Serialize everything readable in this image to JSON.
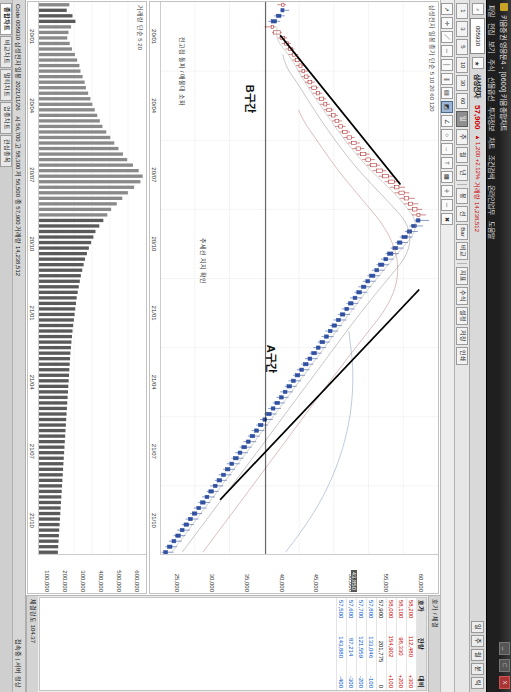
{
  "window": {
    "app_title": "키움증권 영웅문4 - [0600] 키움종합차트",
    "logo_icon": "app-logo-icon",
    "minimize_label": "_",
    "maximize_label": "□",
    "close_label": "X"
  },
  "menu": {
    "items": [
      "파일",
      "편집",
      "보기",
      "주식",
      "선물옵션",
      "투자정보",
      "차트",
      "조건검색",
      "온라인업무",
      "도움말"
    ]
  },
  "quotebar": {
    "code_value": "005930",
    "code_placeholder": "종목코드",
    "stock_name": "삼성전자",
    "chips": [
      "일",
      "주",
      "월",
      "분",
      "틱"
    ],
    "price": "57,900",
    "delta": "▲ 1,200  +2.12%",
    "volume_label": "거래량 14,238,512",
    "search_icon": "search-icon",
    "star_icon": "favorite-star-icon"
  },
  "toolbar_period": {
    "buttons": [
      "1",
      "3",
      "5",
      "10",
      "30",
      "60",
      "일",
      "주",
      "월",
      "년"
    ],
    "active": "일",
    "chart_types": [
      "봉",
      "선",
      "Bar",
      "비교"
    ],
    "extras": [
      "지표",
      "수식",
      "설정",
      "저장",
      "인쇄"
    ]
  },
  "drawing_toolbar": {
    "tools": [
      {
        "name": "pointer-icon",
        "glyph": "➚"
      },
      {
        "name": "crosshair-icon",
        "glyph": "✛"
      },
      {
        "name": "trendline-icon",
        "glyph": "／"
      },
      {
        "name": "horizontal-line-icon",
        "glyph": "─"
      },
      {
        "name": "vertical-line-icon",
        "glyph": "│"
      },
      {
        "name": "parallel-line-icon",
        "glyph": "∥"
      },
      {
        "name": "fibonacci-icon",
        "glyph": "▤"
      },
      {
        "name": "channel-icon",
        "glyph": "◩"
      },
      {
        "name": "angle-icon",
        "glyph": "∠"
      },
      {
        "name": "ellipse-icon",
        "glyph": "○"
      },
      {
        "name": "arrow-icon",
        "glyph": "→"
      },
      {
        "name": "text-icon",
        "glyph": "T"
      },
      {
        "name": "note-icon",
        "glyph": "▦"
      },
      {
        "name": "zoom-in-icon",
        "glyph": "＋"
      },
      {
        "name": "zoom-out-icon",
        "glyph": "－"
      },
      {
        "name": "erase-icon",
        "glyph": "✖"
      }
    ],
    "selected_index": 7
  },
  "price_pane": {
    "title": "삼성전자 일봉  종가 단순 5 10 20 60 120",
    "y_ticks": [
      "60,000",
      "55,000",
      "50,000",
      "45,000",
      "40,000",
      "35,000",
      "30,000",
      "25,000"
    ],
    "x_ticks": [
      "20/01",
      "20/04",
      "20/07",
      "20/10",
      "21/01",
      "21/04",
      "21/07",
      "21/10"
    ],
    "cursor_price": "43,850",
    "annotations": [
      {
        "name": "annotation-a-section",
        "text": "A구간"
      },
      {
        "name": "annotation-b-section",
        "text": "B구간"
      },
      {
        "name": "annotation-trendline-support",
        "text": "추세선 지지 확인"
      },
      {
        "name": "annotation-breakout",
        "text": "전고점 돌파 / 매물대 소화"
      }
    ]
  },
  "volume_pane": {
    "title": "거래량 단순 5 20",
    "y_ticks": [
      "600,000",
      "500,000",
      "400,000",
      "300,000",
      "200,000",
      "100,000"
    ],
    "x_ticks": [
      "20/01",
      "20/04",
      "20/07",
      "20/10",
      "21/01",
      "21/04",
      "21/07",
      "21/10"
    ]
  },
  "side_panel": {
    "header": "호가 / 체결",
    "columns": [
      "호가",
      "잔량",
      "대비"
    ],
    "rows": [
      {
        "price": "58,200",
        "qty": "112,480",
        "chg": "+300"
      },
      {
        "price": "58,100",
        "qty": "98,330",
        "chg": "+200"
      },
      {
        "price": "58,000",
        "qty": "154,902",
        "chg": "+100"
      },
      {
        "price": "57,900",
        "qty": "201,775",
        "chg": "0"
      },
      {
        "price": "57,800",
        "qty": "133,046",
        "chg": "-100"
      },
      {
        "price": "57,700",
        "qty": "121,559",
        "chg": "-200"
      },
      {
        "price": "57,600",
        "qty": "87,214",
        "chg": "-300"
      },
      {
        "price": "57,500",
        "qty": "143,880",
        "chg": "-400"
      }
    ],
    "footer_label": "체결강도",
    "footer_value": "104.37"
  },
  "status": {
    "left": "Code 005930 삼성전자 일봉 2021/11/26",
    "middle": "시 56,700  고 58,300  저 56,500  종 57,900  거래량 14,238,512",
    "right": "접속중 | 서버 정상"
  },
  "tabs": {
    "items": [
      "종합차트",
      "비교차트",
      "멀티차트",
      "업종차트",
      "관심종목"
    ],
    "active": "종합차트"
  },
  "chart_data": {
    "type": "line",
    "xlabel": "",
    "ylabel": "가격 (원)",
    "ylim": [
      25000,
      62000
    ],
    "vol_ylim": [
      0,
      620000
    ],
    "x_tick_labels": [
      "20/01",
      "20/04",
      "20/07",
      "20/10",
      "21/01",
      "21/04",
      "21/07",
      "21/10"
    ],
    "y_tick_labels": [
      "60,000",
      "55,000",
      "50,000",
      "45,000",
      "40,000",
      "35,000",
      "30,000",
      "25,000"
    ],
    "legend": [
      "종가 단순 5",
      "10",
      "20",
      "60",
      "120"
    ],
    "grid": true,
    "candles": [
      {
        "o": 41200,
        "h": 41800,
        "l": 40600,
        "c": 41500,
        "v": 180000
      },
      {
        "o": 41500,
        "h": 42200,
        "l": 41000,
        "c": 41100,
        "v": 165000
      },
      {
        "o": 41100,
        "h": 41600,
        "l": 40200,
        "c": 40500,
        "v": 198000
      },
      {
        "o": 40500,
        "h": 41000,
        "l": 39400,
        "c": 39800,
        "v": 215000
      },
      {
        "o": 39800,
        "h": 40400,
        "l": 38900,
        "c": 40100,
        "v": 190000
      },
      {
        "o": 40100,
        "h": 41200,
        "l": 39900,
        "c": 41000,
        "v": 175000
      },
      {
        "o": 41000,
        "h": 41900,
        "l": 40700,
        "c": 41600,
        "v": 168000
      },
      {
        "o": 41600,
        "h": 42400,
        "l": 41200,
        "c": 42100,
        "v": 182000
      },
      {
        "o": 42100,
        "h": 42900,
        "l": 41700,
        "c": 42600,
        "v": 195000
      },
      {
        "o": 42600,
        "h": 43400,
        "l": 42100,
        "c": 43000,
        "v": 212000
      },
      {
        "o": 43000,
        "h": 43800,
        "l": 42600,
        "c": 43500,
        "v": 225000
      },
      {
        "o": 43500,
        "h": 44300,
        "l": 43100,
        "c": 43900,
        "v": 238000
      },
      {
        "o": 43900,
        "h": 44700,
        "l": 43400,
        "c": 44200,
        "v": 244000
      },
      {
        "o": 44200,
        "h": 45000,
        "l": 43800,
        "c": 44700,
        "v": 256000
      },
      {
        "o": 44700,
        "h": 45600,
        "l": 44300,
        "c": 45200,
        "v": 268000
      },
      {
        "o": 45200,
        "h": 46100,
        "l": 44800,
        "c": 45800,
        "v": 275000
      },
      {
        "o": 45800,
        "h": 46600,
        "l": 45300,
        "c": 46200,
        "v": 288000
      },
      {
        "o": 46200,
        "h": 47100,
        "l": 45800,
        "c": 46800,
        "v": 301000
      },
      {
        "o": 46800,
        "h": 47600,
        "l": 46300,
        "c": 47200,
        "v": 312000
      },
      {
        "o": 47200,
        "h": 48100,
        "l": 46800,
        "c": 47800,
        "v": 326000
      },
      {
        "o": 47800,
        "h": 48700,
        "l": 47300,
        "c": 48300,
        "v": 340000
      },
      {
        "o": 48300,
        "h": 49200,
        "l": 47900,
        "c": 48800,
        "v": 355000
      },
      {
        "o": 48800,
        "h": 49700,
        "l": 48300,
        "c": 49300,
        "v": 370000
      },
      {
        "o": 49300,
        "h": 50300,
        "l": 48900,
        "c": 49900,
        "v": 392000
      },
      {
        "o": 49900,
        "h": 50900,
        "l": 49400,
        "c": 50500,
        "v": 415000
      },
      {
        "o": 50500,
        "h": 51600,
        "l": 50000,
        "c": 51100,
        "v": 438000
      },
      {
        "o": 51100,
        "h": 52200,
        "l": 50600,
        "c": 51700,
        "v": 462000
      },
      {
        "o": 51700,
        "h": 52900,
        "l": 51200,
        "c": 52400,
        "v": 488000
      },
      {
        "o": 52400,
        "h": 53600,
        "l": 51900,
        "c": 53000,
        "v": 512000
      },
      {
        "o": 53000,
        "h": 54300,
        "l": 52500,
        "c": 53800,
        "v": 545000
      },
      {
        "o": 53800,
        "h": 55100,
        "l": 53300,
        "c": 54600,
        "v": 578000
      },
      {
        "o": 54600,
        "h": 56000,
        "l": 54100,
        "c": 55400,
        "v": 601000
      },
      {
        "o": 55400,
        "h": 56900,
        "l": 54900,
        "c": 56200,
        "v": 588000
      },
      {
        "o": 56200,
        "h": 57600,
        "l": 55600,
        "c": 56800,
        "v": 552000
      },
      {
        "o": 56800,
        "h": 58200,
        "l": 56200,
        "c": 57500,
        "v": 516000
      },
      {
        "o": 57500,
        "h": 58900,
        "l": 56900,
        "c": 58100,
        "v": 484000
      },
      {
        "o": 58100,
        "h": 59400,
        "l": 57500,
        "c": 58600,
        "v": 452000
      },
      {
        "o": 58600,
        "h": 59900,
        "l": 58000,
        "c": 59200,
        "v": 420000
      },
      {
        "o": 59200,
        "h": 60400,
        "l": 58500,
        "c": 59600,
        "v": 398000
      },
      {
        "o": 59600,
        "h": 60800,
        "l": 58900,
        "c": 59100,
        "v": 375000
      },
      {
        "o": 59100,
        "h": 60000,
        "l": 58200,
        "c": 58500,
        "v": 352000
      },
      {
        "o": 58500,
        "h": 59300,
        "l": 57600,
        "c": 57900,
        "v": 330000
      },
      {
        "o": 57900,
        "h": 58600,
        "l": 56900,
        "c": 57200,
        "v": 318000
      },
      {
        "o": 57200,
        "h": 58000,
        "l": 56300,
        "c": 56600,
        "v": 305000
      },
      {
        "o": 56600,
        "h": 57400,
        "l": 55700,
        "c": 56000,
        "v": 292000
      },
      {
        "o": 56000,
        "h": 56800,
        "l": 55000,
        "c": 55300,
        "v": 281000
      },
      {
        "o": 55300,
        "h": 56100,
        "l": 54400,
        "c": 54800,
        "v": 270000
      },
      {
        "o": 54800,
        "h": 55500,
        "l": 53800,
        "c": 54100,
        "v": 262000
      },
      {
        "o": 54100,
        "h": 54900,
        "l": 53200,
        "c": 53600,
        "v": 254000
      },
      {
        "o": 53600,
        "h": 54300,
        "l": 52600,
        "c": 52900,
        "v": 246000
      },
      {
        "o": 52900,
        "h": 53700,
        "l": 52000,
        "c": 52400,
        "v": 240000
      },
      {
        "o": 52400,
        "h": 53100,
        "l": 51400,
        "c": 51800,
        "v": 234000
      },
      {
        "o": 51800,
        "h": 52600,
        "l": 50900,
        "c": 51200,
        "v": 228000
      },
      {
        "o": 51200,
        "h": 51900,
        "l": 50300,
        "c": 50700,
        "v": 222000
      },
      {
        "o": 50700,
        "h": 51400,
        "l": 49800,
        "c": 50100,
        "v": 218000
      },
      {
        "o": 50100,
        "h": 50900,
        "l": 49200,
        "c": 49600,
        "v": 214000
      },
      {
        "o": 49600,
        "h": 50300,
        "l": 48700,
        "c": 49000,
        "v": 210000
      },
      {
        "o": 49000,
        "h": 49800,
        "l": 48100,
        "c": 48500,
        "v": 206000
      },
      {
        "o": 48500,
        "h": 49200,
        "l": 47600,
        "c": 47900,
        "v": 202000
      },
      {
        "o": 47900,
        "h": 48700,
        "l": 47000,
        "c": 47400,
        "v": 198000
      },
      {
        "o": 47400,
        "h": 48100,
        "l": 46500,
        "c": 46900,
        "v": 195000
      },
      {
        "o": 46900,
        "h": 47600,
        "l": 46000,
        "c": 46300,
        "v": 192000
      },
      {
        "o": 46300,
        "h": 47100,
        "l": 45400,
        "c": 45800,
        "v": 189000
      },
      {
        "o": 45800,
        "h": 46500,
        "l": 44900,
        "c": 45200,
        "v": 186000
      },
      {
        "o": 45200,
        "h": 46000,
        "l": 44300,
        "c": 44700,
        "v": 184000
      },
      {
        "o": 44700,
        "h": 45400,
        "l": 43800,
        "c": 44100,
        "v": 182000
      },
      {
        "o": 44100,
        "h": 44900,
        "l": 43200,
        "c": 43600,
        "v": 180000
      },
      {
        "o": 43600,
        "h": 44300,
        "l": 42700,
        "c": 43000,
        "v": 178000
      },
      {
        "o": 43000,
        "h": 43800,
        "l": 42100,
        "c": 42500,
        "v": 176000
      },
      {
        "o": 42500,
        "h": 43200,
        "l": 41600,
        "c": 41900,
        "v": 174000
      },
      {
        "o": 41900,
        "h": 42700,
        "l": 41000,
        "c": 41400,
        "v": 172000
      },
      {
        "o": 41400,
        "h": 42100,
        "l": 40500,
        "c": 40900,
        "v": 170000
      },
      {
        "o": 40900,
        "h": 41600,
        "l": 40000,
        "c": 40300,
        "v": 168000
      },
      {
        "o": 40300,
        "h": 41100,
        "l": 39400,
        "c": 39800,
        "v": 166000
      },
      {
        "o": 39800,
        "h": 40500,
        "l": 38900,
        "c": 39200,
        "v": 164000
      },
      {
        "o": 39200,
        "h": 40000,
        "l": 38300,
        "c": 38700,
        "v": 162000
      },
      {
        "o": 38700,
        "h": 39400,
        "l": 37800,
        "c": 38100,
        "v": 160000
      },
      {
        "o": 38100,
        "h": 38900,
        "l": 37200,
        "c": 37600,
        "v": 158000
      },
      {
        "o": 37600,
        "h": 38300,
        "l": 36700,
        "c": 37000,
        "v": 156000
      },
      {
        "o": 37000,
        "h": 37800,
        "l": 36100,
        "c": 36500,
        "v": 154000
      },
      {
        "o": 36500,
        "h": 37200,
        "l": 35600,
        "c": 35900,
        "v": 152000
      },
      {
        "o": 35900,
        "h": 36700,
        "l": 35000,
        "c": 35400,
        "v": 150000
      },
      {
        "o": 35400,
        "h": 36100,
        "l": 34500,
        "c": 34800,
        "v": 148000
      },
      {
        "o": 34800,
        "h": 35600,
        "l": 33900,
        "c": 34300,
        "v": 146000
      },
      {
        "o": 34300,
        "h": 35000,
        "l": 33400,
        "c": 33700,
        "v": 144000
      },
      {
        "o": 33700,
        "h": 34500,
        "l": 32800,
        "c": 33200,
        "v": 142000
      },
      {
        "o": 33200,
        "h": 33900,
        "l": 32300,
        "c": 32600,
        "v": 140000
      },
      {
        "o": 32600,
        "h": 33400,
        "l": 31700,
        "c": 32100,
        "v": 138000
      },
      {
        "o": 32100,
        "h": 32800,
        "l": 31200,
        "c": 31500,
        "v": 136000
      },
      {
        "o": 31500,
        "h": 32300,
        "l": 30600,
        "c": 31000,
        "v": 134000
      },
      {
        "o": 31000,
        "h": 31700,
        "l": 30100,
        "c": 30400,
        "v": 132000
      },
      {
        "o": 30400,
        "h": 31200,
        "l": 29500,
        "c": 29900,
        "v": 130000
      },
      {
        "o": 29900,
        "h": 30600,
        "l": 29000,
        "c": 29300,
        "v": 128000
      },
      {
        "o": 29300,
        "h": 30100,
        "l": 28400,
        "c": 28800,
        "v": 126000
      },
      {
        "o": 28800,
        "h": 29500,
        "l": 27900,
        "c": 28200,
        "v": 124000
      },
      {
        "o": 28200,
        "h": 29000,
        "l": 27300,
        "c": 27700,
        "v": 122000
      },
      {
        "o": 27700,
        "h": 28400,
        "l": 26800,
        "c": 27100,
        "v": 120000
      },
      {
        "o": 27100,
        "h": 27900,
        "l": 26200,
        "c": 26600,
        "v": 118000
      },
      {
        "o": 26600,
        "h": 27300,
        "l": 25700,
        "c": 26000,
        "v": 116000
      },
      {
        "o": 26000,
        "h": 26800,
        "l": 25200,
        "c": 25500,
        "v": 114000
      }
    ],
    "trendlines": [
      {
        "name": "b-section-uptrend",
        "x1": 0.06,
        "y1": 41000,
        "x2": 0.33,
        "y2": 57000
      },
      {
        "name": "a-section-downtrend",
        "x1": 0.52,
        "y1": 59500,
        "x2": 0.9,
        "y2": 33000
      }
    ],
    "divider_x": 0.455
  }
}
